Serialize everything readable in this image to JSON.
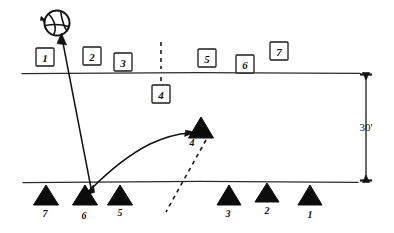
{
  "diagram": {
    "ink_color": "#111111",
    "background_color": "#ffffff",
    "dimension": {
      "label": "30'",
      "value": 30,
      "unit": "feet",
      "orientation": "vertical",
      "from_line": "net-line",
      "to_line": "baseline"
    },
    "court_lines": [
      {
        "name": "net-line",
        "y": 73,
        "x1": 22,
        "x2": 360
      },
      {
        "name": "baseline",
        "y": 182,
        "x1": 23,
        "x2": 358
      }
    ],
    "center_dash": {
      "name": "center-line-dashed",
      "x": 161,
      "y1": 42,
      "y2": 86
    },
    "ball": {
      "label": "ball",
      "cx": 57,
      "cy": 23,
      "r": 13
    },
    "boxed_players": [
      {
        "id": "box-1",
        "label": "1",
        "x": 36,
        "y": 48
      },
      {
        "id": "box-2",
        "label": "2",
        "x": 83,
        "y": 47
      },
      {
        "id": "box-3",
        "label": "3",
        "x": 114,
        "y": 53
      },
      {
        "id": "box-4",
        "label": "4",
        "x": 152,
        "y": 85
      },
      {
        "id": "box-5",
        "label": "5",
        "x": 198,
        "y": 49
      },
      {
        "id": "box-6",
        "label": "6",
        "x": 236,
        "y": 55
      },
      {
        "id": "box-7",
        "label": "7",
        "x": 270,
        "y": 42
      }
    ],
    "triangle_players": [
      {
        "id": "tri-7",
        "label": "7",
        "x": 46,
        "y": 185
      },
      {
        "id": "tri-6",
        "label": "6",
        "x": 85,
        "y": 185
      },
      {
        "id": "tri-5",
        "label": "5",
        "x": 120,
        "y": 185
      },
      {
        "id": "tri-4",
        "label": "4",
        "x": 201,
        "y": 117
      },
      {
        "id": "tri-3",
        "label": "3",
        "x": 229,
        "y": 185
      },
      {
        "id": "tri-2",
        "label": "2",
        "x": 267,
        "y": 183
      },
      {
        "id": "tri-1",
        "label": "1",
        "x": 310,
        "y": 185
      }
    ],
    "arrows": [
      {
        "id": "serve-arrow",
        "kind": "straight",
        "description": "straight arrow from player 6 up-left to the ball",
        "from": [
          91,
          190
        ],
        "to": [
          62,
          37
        ]
      },
      {
        "id": "movement-arrow",
        "kind": "curved",
        "description": "curved arrow from player 6 sweeping up-right to player 4",
        "from": [
          90,
          189
        ],
        "to": [
          192,
          134
        ]
      }
    ],
    "path_dashed": {
      "id": "player-4-path",
      "description": "dashed path from player 4 triangle down-left across the baseline",
      "from": [
        206,
        140
      ],
      "to": [
        166,
        212
      ]
    }
  }
}
